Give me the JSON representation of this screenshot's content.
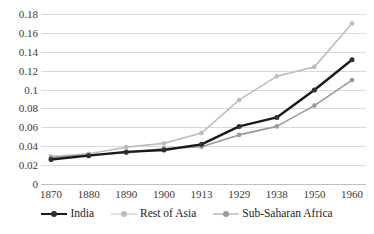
{
  "chart_data": {
    "type": "line",
    "title": "",
    "subtitle": "",
    "xlabel": "",
    "ylabel": "",
    "categories": [
      "1870",
      "1880",
      "1890",
      "1900",
      "1913",
      "1929",
      "1938",
      "1950",
      "1960"
    ],
    "ylim": [
      0,
      0.18
    ],
    "ytick_values": [
      0,
      0.02,
      0.04,
      0.06,
      0.08,
      0.1,
      0.12,
      0.14,
      0.16,
      0.18
    ],
    "ytick_labels": [
      "0",
      "0.02",
      "0.04",
      "0.06",
      "0.08",
      "0.1",
      "0.12",
      "0.14",
      "0.16",
      "0.18"
    ],
    "grid": "horizontal",
    "legend_position": "bottom",
    "series": [
      {
        "name": "India",
        "color": "#1a1a1a",
        "line_width": 2.4,
        "marker": "circle",
        "values": [
          0.026,
          0.03,
          0.034,
          0.036,
          0.042,
          0.061,
          0.0705,
          0.0995,
          0.1315
        ]
      },
      {
        "name": "Rest of Asia",
        "color": "#bdbdbd",
        "line_width": 1.6,
        "marker": "circle",
        "values": [
          0.029,
          0.032,
          0.039,
          0.043,
          0.054,
          0.089,
          0.114,
          0.124,
          0.17
        ]
      },
      {
        "name": "Sub-Saharan Africa",
        "color": "#9a9a9a",
        "line_width": 1.6,
        "marker": "circle",
        "values": [
          0.028,
          0.031,
          0.033,
          0.0375,
          0.0395,
          0.052,
          0.061,
          0.083,
          0.11
        ]
      }
    ]
  },
  "legend": {
    "items": [
      {
        "label": "India"
      },
      {
        "label": "Rest of Asia"
      },
      {
        "label": "Sub-Saharan Africa"
      }
    ]
  },
  "colors": {
    "gridline": "#d9d9d9",
    "axis": "#bfbfbf",
    "background": "#ffffff",
    "text": "#3a3a3a"
  }
}
